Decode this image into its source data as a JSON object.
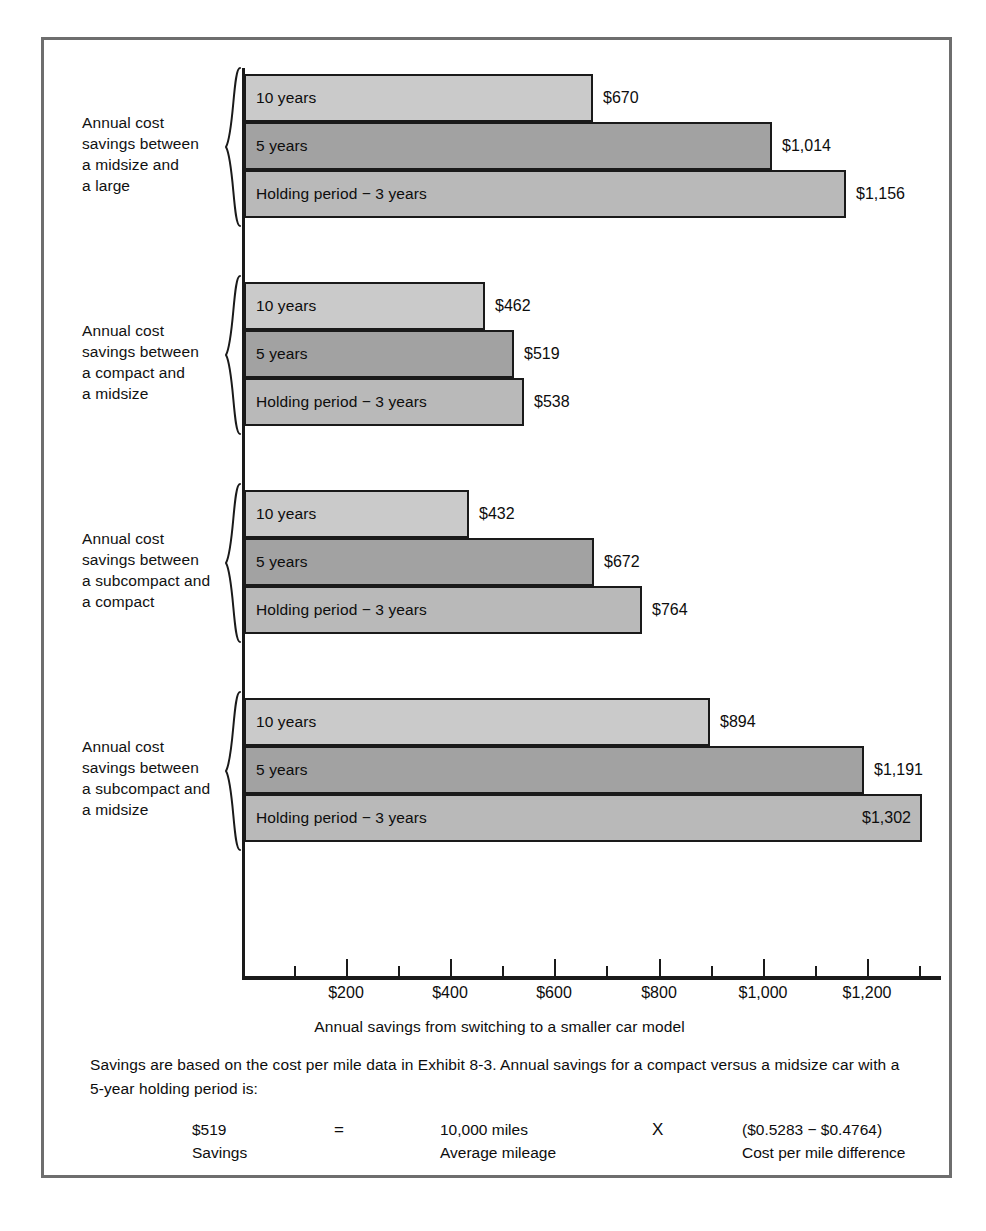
{
  "exhibit": {
    "x_axis_title": "Annual savings from switching to a smaller car model",
    "footnote": "Savings are based on the cost per mile data in Exhibit 8-3. Annual savings for a compact versus a midsize car with a 5-year holding period is:",
    "formula": {
      "value_top": "$519",
      "value_bottom": "Savings",
      "equals": "=",
      "miles_top": "10,000 miles",
      "miles_bottom": "Average mileage",
      "times": "X",
      "cost_top": "($0.5283 − $0.4764)",
      "cost_bottom": "Cost per mile difference"
    }
  },
  "chart_data": {
    "type": "bar",
    "orientation": "horizontal",
    "title": "",
    "xlabel": "Annual savings from switching to a smaller car model",
    "ylabel": "",
    "xlim": [
      0,
      1400
    ],
    "grid": false,
    "legend": "none",
    "x_ticks_major": [
      200,
      400,
      600,
      800,
      1000,
      1200
    ],
    "x_tick_labels": [
      "$200",
      "$400",
      "$600",
      "$800",
      "$1,000",
      "$1,200"
    ],
    "x_ticks_minor": [
      100,
      300,
      500,
      700,
      900,
      1100,
      1300
    ],
    "series_names": [
      "10 years",
      "5 years",
      "Holding period − 3 years"
    ],
    "groups": [
      {
        "label": "Annual cost savings between a midsize and a large",
        "label_lines": [
          "Annual cost",
          "savings between",
          "a midsize and",
          "a large"
        ],
        "bars": [
          {
            "caption": "10 years",
            "value": 670,
            "value_label": "$670",
            "shade": "shade-light",
            "label_inside": false
          },
          {
            "caption": "5 years",
            "value": 1014,
            "value_label": "$1,014",
            "shade": "shade-dark",
            "label_inside": false
          },
          {
            "caption": "Holding period − 3 years",
            "value": 1156,
            "value_label": "$1,156",
            "shade": "shade-mid",
            "label_inside": false
          }
        ]
      },
      {
        "label": "Annual cost savings between a compact and a midsize",
        "label_lines": [
          "Annual cost",
          "savings between",
          "a compact and",
          "a midsize"
        ],
        "bars": [
          {
            "caption": "10 years",
            "value": 462,
            "value_label": "$462",
            "shade": "shade-light",
            "label_inside": false
          },
          {
            "caption": "5 years",
            "value": 519,
            "value_label": "$519",
            "shade": "shade-dark",
            "label_inside": false
          },
          {
            "caption": "Holding period − 3 years",
            "value": 538,
            "value_label": "$538",
            "shade": "shade-mid",
            "label_inside": false
          }
        ]
      },
      {
        "label": "Annual cost savings between a subcompact and a compact",
        "label_lines": [
          "Annual cost",
          "savings between",
          "a subcompact and",
          "a compact"
        ],
        "bars": [
          {
            "caption": "10 years",
            "value": 432,
            "value_label": "$432",
            "shade": "shade-light",
            "label_inside": false
          },
          {
            "caption": "5 years",
            "value": 672,
            "value_label": "$672",
            "shade": "shade-dark",
            "label_inside": false
          },
          {
            "caption": "Holding period − 3 years",
            "value": 764,
            "value_label": "$764",
            "shade": "shade-mid",
            "label_inside": false
          }
        ]
      },
      {
        "label": "Annual cost savings between a subcompact and a midsize",
        "label_lines": [
          "Annual cost",
          "savings between",
          "a subcompact and",
          "a midsize"
        ],
        "bars": [
          {
            "caption": "10 years",
            "value": 894,
            "value_label": "$894",
            "shade": "shade-light",
            "label_inside": false
          },
          {
            "caption": "5 years",
            "value": 1191,
            "value_label": "$1,191",
            "shade": "shade-dark",
            "label_inside": false
          },
          {
            "caption": "Holding period − 3 years",
            "value": 1302,
            "value_label": "$1,302",
            "shade": "shade-mid",
            "label_inside": true
          }
        ]
      }
    ],
    "colors": {
      "shade_light": "#cacaca",
      "shade_mid": "#b9b9b9",
      "shade_dark": "#a2a2a2",
      "outline": "#1a1a1a",
      "frame": "#6e6e6e",
      "background": "#ffffff"
    }
  }
}
